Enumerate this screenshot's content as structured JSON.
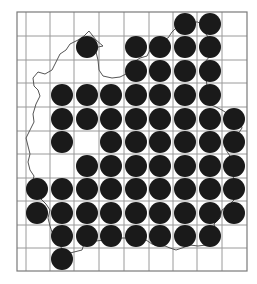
{
  "map": {
    "type": "grid distribution map",
    "grid": {
      "left": 17,
      "right": 247,
      "top": 12,
      "bottom": 271,
      "vertical_lines": [
        26,
        50,
        74,
        99,
        124,
        149,
        173,
        197,
        222
      ],
      "horizontal_lines": [
        36,
        60,
        83,
        107,
        131,
        154,
        178,
        201,
        225,
        248
      ],
      "line_color": "#9a9a9a",
      "border_color": "#7a7a7a"
    },
    "dot_style": {
      "radius": 11,
      "color": "#1a1a1a"
    },
    "column_centers": [
      37,
      62,
      87,
      111,
      136,
      160,
      185,
      210,
      234
    ],
    "row_centers": [
      24,
      47,
      71,
      95,
      119,
      142,
      166,
      189,
      213,
      236,
      259
    ],
    "occupied_cells": [
      {
        "row": 0,
        "cols": [
          6,
          7
        ]
      },
      {
        "row": 1,
        "cols": [
          2,
          4,
          5,
          6,
          7
        ]
      },
      {
        "row": 2,
        "cols": [
          4,
          5,
          6,
          7
        ]
      },
      {
        "row": 3,
        "cols": [
          1,
          2,
          3,
          4,
          5,
          6,
          7
        ]
      },
      {
        "row": 4,
        "cols": [
          1,
          2,
          3,
          4,
          5,
          6,
          7,
          8
        ]
      },
      {
        "row": 5,
        "cols": [
          1,
          3,
          4,
          5,
          6,
          7,
          8
        ]
      },
      {
        "row": 6,
        "cols": [
          2,
          3,
          4,
          5,
          6,
          7,
          8
        ]
      },
      {
        "row": 7,
        "cols": [
          0,
          1,
          2,
          3,
          4,
          5,
          6,
          7,
          8
        ]
      },
      {
        "row": 8,
        "cols": [
          0,
          1,
          2,
          3,
          4,
          5,
          6,
          7,
          8
        ]
      },
      {
        "row": 9,
        "cols": [
          1,
          2,
          3,
          4,
          5,
          6,
          7
        ]
      },
      {
        "row": 10,
        "cols": [
          1
        ]
      }
    ],
    "outline": {
      "color": "#555555",
      "points": "33,78 38,72 45,74 52,70 56,62 60,54 66,50 70,44 78,40 84,36 89,31 96,40 103,46 98,47 96,52 98,60 99,70 103,76 112,78 120,77 126,74 130,68 134,62 140,58 147,56 150,50 156,46 162,40 168,38 172,32 176,28 183,24 190,22 198,22 204,28 206,34 210,40 212,48 210,56 205,62 208,70 206,78 207,86 205,94 202,100 208,104 214,106 222,110 228,114 236,116 240,120 242,128 238,134 232,138 226,142 226,150 230,156 228,164 232,172 234,180 232,190 234,200 228,206 222,210 220,218 214,224 216,232 214,240 206,245 198,246 190,245 182,248 176,250 170,248 165,246 158,246 152,244 146,240 138,240 130,238 122,238 114,240 104,240 96,241 90,240 84,244 82,250 74,252 66,254 62,250 60,244 56,238 52,232 50,226 48,218 50,210 46,204 40,198 34,190 32,184 34,176 30,170 28,162 30,154 28,146 26,138 30,130 34,122 33,114 36,104 40,96 38,90 34,86 33,78"
    }
  }
}
